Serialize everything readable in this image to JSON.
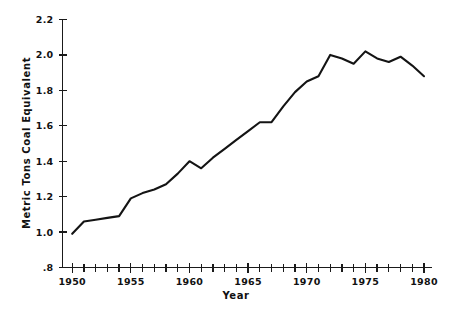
{
  "chart_data": {
    "type": "line",
    "title": "",
    "xlabel": "Year",
    "ylabel": "Metric Tons Coal Equivalent",
    "xlim": [
      1949,
      1981
    ],
    "ylim": [
      0.8,
      2.2
    ],
    "grid": false,
    "legend": null,
    "x_tick_labels": [
      "1950",
      "1955",
      "1960",
      "1965",
      "1970",
      "1975",
      "1980"
    ],
    "x_tick_values": [
      1950,
      1955,
      1960,
      1965,
      1970,
      1975,
      1980
    ],
    "x_minor_tick_interval": 1,
    "y_tick_labels": [
      ".8",
      "1.0",
      "1.2",
      "1.4",
      "1.6",
      "1.8",
      "2.0",
      "2.2"
    ],
    "y_tick_values": [
      0.8,
      1.0,
      1.2,
      1.4,
      1.6,
      1.8,
      2.0,
      2.2
    ],
    "series": [
      {
        "name": "Metric Tons Coal Equivalent",
        "color": "#141414",
        "x": [
          1950,
          1951,
          1952,
          1953,
          1954,
          1955,
          1956,
          1957,
          1958,
          1959,
          1960,
          1961,
          1962,
          1963,
          1964,
          1965,
          1966,
          1967,
          1968,
          1969,
          1970,
          1971,
          1972,
          1973,
          1974,
          1975,
          1976,
          1977,
          1978,
          1979,
          1980
        ],
        "values": [
          0.99,
          1.06,
          1.07,
          1.08,
          1.09,
          1.19,
          1.22,
          1.24,
          1.27,
          1.33,
          1.4,
          1.36,
          1.42,
          1.47,
          1.52,
          1.57,
          1.62,
          1.62,
          1.71,
          1.79,
          1.85,
          1.88,
          2.0,
          1.98,
          1.95,
          2.02,
          1.98,
          1.96,
          1.99,
          1.94,
          1.88
        ]
      }
    ]
  },
  "axis": {
    "x_title": "Year",
    "y_title": "Metric Tons Coal Equivalent"
  }
}
